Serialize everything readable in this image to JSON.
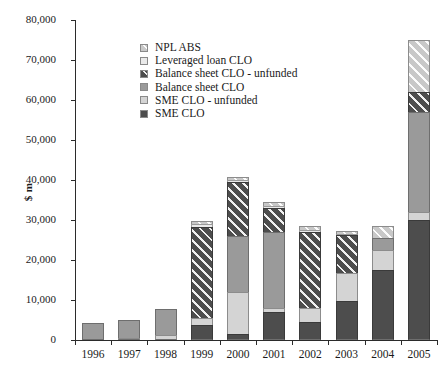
{
  "chart_data": {
    "type": "bar",
    "subtype": "stacked",
    "title": "",
    "xlabel": "",
    "ylabel": "$ m",
    "ylim": [
      0,
      80000
    ],
    "ytick_step": 10000,
    "ytick_labels": [
      "80,000",
      "70,000",
      "60,000",
      "50,000",
      "40,000",
      "30,000",
      "20,000",
      "10,000",
      "0"
    ],
    "ytick_values": [
      80000,
      70000,
      60000,
      50000,
      40000,
      30000,
      20000,
      10000,
      0
    ],
    "grid": false,
    "legend_position": "upper-left-inside",
    "categories": [
      "1996",
      "1997",
      "1998",
      "1999",
      "2000",
      "2001",
      "2002",
      "2003",
      "2004",
      "2005"
    ],
    "series": [
      {
        "name": "SME CLO",
        "key": "sme-clo",
        "color": "#4d4d4d",
        "pattern": "solid",
        "values": [
          0,
          0,
          0,
          3800,
          1500,
          7000,
          4500,
          9700,
          17500,
          30000
        ]
      },
      {
        "name": "SME CLO - unfunded",
        "key": "sme-clo-unfunded",
        "color": "#d4d4d4",
        "pattern": "solid",
        "values": [
          0,
          500,
          1200,
          1700,
          10500,
          1000,
          3500,
          7000,
          5000,
          2000
        ]
      },
      {
        "name": "Balance sheet CLO",
        "key": "balance-sheet-clo",
        "color": "#9a9a9a",
        "pattern": "solid",
        "values": [
          4200,
          4600,
          6600,
          0,
          14000,
          19000,
          0,
          0,
          3000,
          25000
        ]
      },
      {
        "name": "Balance sheet CLO - unfunded",
        "key": "balance-sheet-clo-unfunded",
        "color": "#4d4d4d",
        "pattern": "diagonal-hatch",
        "values": [
          0,
          0,
          0,
          22800,
          13500,
          6000,
          19000,
          9500,
          0,
          5000
        ]
      },
      {
        "name": "Leveraged loan CLO",
        "key": "leveraged-loan-clo",
        "color": "#eaeaea",
        "pattern": "solid",
        "values": [
          0,
          0,
          0,
          800,
          600,
          500,
          600,
          400,
          0,
          0
        ]
      },
      {
        "name": "NPL ABS",
        "key": "npl-abs",
        "color": "#c8c8c8",
        "pattern": "diagonal-hatch",
        "values": [
          0,
          0,
          0,
          600,
          700,
          1000,
          1000,
          600,
          3000,
          13000
        ]
      }
    ],
    "totals": [
      4200,
      5100,
      7800,
      29700,
      40800,
      34500,
      28600,
      27200,
      28500,
      75000
    ]
  },
  "legend": {
    "items": [
      {
        "label": "NPL ABS",
        "swatch": "npl-abs-swatch"
      },
      {
        "label": "Leveraged loan CLO",
        "swatch": "leveraged-loan-clo-swatch"
      },
      {
        "label": "Balance sheet CLO - unfunded",
        "swatch": "balance-sheet-clo-unfunded-swatch"
      },
      {
        "label": "Balance sheet CLO",
        "swatch": "balance-sheet-clo-swatch"
      },
      {
        "label": "SME CLO - unfunded",
        "swatch": "sme-clo-unfunded-swatch"
      },
      {
        "label": "SME CLO",
        "swatch": "sme-clo-swatch"
      }
    ]
  }
}
